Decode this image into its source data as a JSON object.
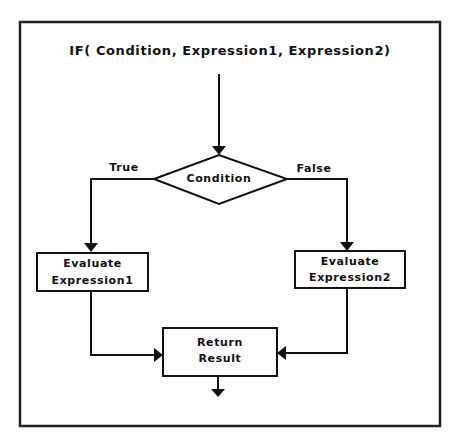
{
  "diagram": {
    "title": "IF( Condition, Expression1, Expression2)",
    "decision": {
      "label": "Condition"
    },
    "branches": {
      "true_label": "True",
      "false_label": "False"
    },
    "true_box": {
      "line1": "Evaluate",
      "line2": "Expression1"
    },
    "false_box": {
      "line1": "Evaluate",
      "line2": "Expression2"
    },
    "result_box": {
      "line1": "Return",
      "line2": "Result"
    },
    "colors": {
      "stroke": "#111111",
      "background": "#ffffff"
    }
  }
}
